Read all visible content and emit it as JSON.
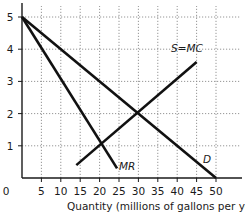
{
  "chart_data": {
    "type": "line",
    "title": "",
    "xlabel": "Quantity (millions of gallons per year)",
    "ylabel": "",
    "xlim": [
      0,
      50
    ],
    "ylim": [
      0,
      5
    ],
    "x_ticks": [
      0,
      5,
      10,
      15,
      20,
      25,
      30,
      35,
      40,
      45,
      50
    ],
    "y_ticks": [
      1,
      2,
      3,
      4,
      5
    ],
    "grid": true,
    "series": [
      {
        "name": "D",
        "points": [
          [
            0,
            5
          ],
          [
            50,
            0
          ]
        ]
      },
      {
        "name": "MR",
        "points": [
          [
            0,
            5
          ],
          [
            24.5,
            0.3
          ]
        ]
      },
      {
        "name": "S=MC",
        "points": [
          [
            14,
            0.4
          ],
          [
            45,
            3.6
          ]
        ]
      }
    ],
    "annotations": [
      {
        "text": "S=MC",
        "x": 41,
        "y": 4.1
      },
      {
        "text": "MR",
        "x": 27,
        "y": 0.6
      },
      {
        "text": "D",
        "x": 44,
        "y": 0.6
      },
      {
        "text": "MR=MC intersection",
        "x": 20,
        "y": 1
      },
      {
        "text": "D=MC intersection",
        "x": 30,
        "y": 2
      }
    ]
  },
  "labels": {
    "origin": "0",
    "x_axis_title": "Quantity (millions of gallons per year)",
    "supply": "S=MC",
    "mr": "MR",
    "demand": "D"
  }
}
